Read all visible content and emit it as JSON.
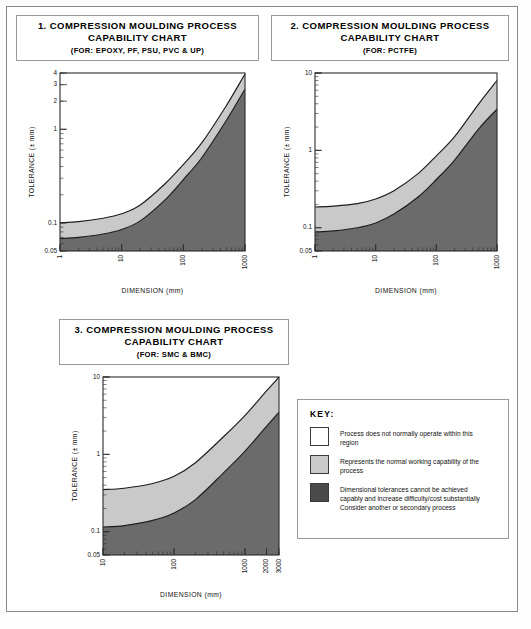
{
  "key_panel": {
    "title": "KEY:",
    "entries": [
      {
        "swatch": "white",
        "text": "Process does not normally operate within this region"
      },
      {
        "swatch": "light-gray",
        "text": "Represents the normal working capability of the process"
      },
      {
        "swatch": "dark-gray",
        "text": "Dimensional tolerances cannot be achieved capably and increase difficulty/cost substantially Consider another or secondary process"
      }
    ]
  },
  "colors": {
    "band_light": "#c9c9c9",
    "band_dark": "#6b6b6b",
    "curve": "#1c1c1c",
    "frame": "#8a8a8a"
  },
  "chart_data": [
    {
      "type": "area",
      "id": "chart-1",
      "title": "1. COMPRESSION MOULDING PROCESS CAPABILITY CHART",
      "subtitle": "(FOR: EPOXY, PF, PSU, PVC & UP)",
      "xlabel": "DIMENSION (mm)",
      "ylabel": "TOLERANCE (± mm)",
      "xscale": "log",
      "yscale": "log",
      "xlim": [
        1,
        1000
      ],
      "ylim": [
        0.05,
        4
      ],
      "xticks": [
        1,
        10,
        100,
        1000
      ],
      "xticklabels": [
        "1",
        "10",
        "100",
        "1000"
      ],
      "yticks": [
        0.05,
        0.1,
        1,
        2,
        3,
        4
      ],
      "yticklabels": [
        "0.05",
        "0.1",
        "1",
        "2",
        "3",
        "4"
      ],
      "grid": false,
      "legend": "none",
      "series": [
        {
          "name": "upper boundary",
          "x": [
            1,
            2,
            5,
            10,
            20,
            50,
            100,
            200,
            500,
            1000
          ],
          "y": [
            0.1,
            0.103,
            0.112,
            0.125,
            0.155,
            0.26,
            0.42,
            0.72,
            1.8,
            3.9
          ]
        },
        {
          "name": "lower boundary",
          "x": [
            1,
            2,
            5,
            10,
            20,
            50,
            100,
            200,
            500,
            1000
          ],
          "y": [
            0.068,
            0.07,
            0.076,
            0.085,
            0.105,
            0.175,
            0.29,
            0.5,
            1.25,
            2.7
          ]
        }
      ]
    },
    {
      "type": "area",
      "id": "chart-2",
      "title": "2. COMPRESSION MOULDING PROCESS CAPABILITY CHART",
      "subtitle": "(FOR: PCTFE)",
      "xlabel": "DIMENSION (mm)",
      "ylabel": "TOLERANCE (± mm)",
      "xscale": "log",
      "yscale": "log",
      "xlim": [
        1,
        1000
      ],
      "ylim": [
        0.05,
        10
      ],
      "xticks": [
        1,
        10,
        100,
        1000
      ],
      "xticklabels": [
        "1",
        "10",
        "100",
        "1000"
      ],
      "yticks": [
        0.05,
        0.1,
        1,
        10
      ],
      "yticklabels": [
        "0.05",
        "0.1",
        "1",
        "10"
      ],
      "grid": false,
      "legend": "none",
      "series": [
        {
          "name": "upper boundary",
          "x": [
            1,
            2,
            5,
            10,
            20,
            50,
            100,
            200,
            500,
            1000
          ],
          "y": [
            0.185,
            0.19,
            0.205,
            0.235,
            0.3,
            0.5,
            0.85,
            1.5,
            4.0,
            8.0
          ]
        },
        {
          "name": "lower boundary",
          "x": [
            1,
            2,
            5,
            10,
            20,
            50,
            100,
            200,
            500,
            1000
          ],
          "y": [
            0.088,
            0.091,
            0.1,
            0.115,
            0.15,
            0.25,
            0.42,
            0.75,
            1.9,
            3.4
          ]
        }
      ]
    },
    {
      "type": "area",
      "id": "chart-3",
      "title": "3. COMPRESSION MOULDING PROCESS CAPABILITY CHART",
      "subtitle": "(FOR: SMC & BMC)",
      "xlabel": "DIMENSION (mm)",
      "ylabel": "TOLERANCE (± mm)",
      "xscale": "log",
      "yscale": "log",
      "xlim": [
        10,
        3000
      ],
      "ylim": [
        0.05,
        10
      ],
      "xticks": [
        10,
        100,
        1000,
        2000,
        3000
      ],
      "xticklabels": [
        "10",
        "100",
        "1000",
        "2000",
        "3000"
      ],
      "yticks": [
        0.05,
        0.1,
        1,
        10
      ],
      "yticklabels": [
        "0.05",
        "0.1",
        "1",
        "10"
      ],
      "grid": false,
      "legend": "none",
      "series": [
        {
          "name": "upper boundary",
          "x": [
            10,
            20,
            50,
            100,
            200,
            500,
            1000,
            2000,
            3000
          ],
          "y": [
            0.35,
            0.365,
            0.42,
            0.52,
            0.78,
            1.7,
            3.2,
            6.6,
            10.0
          ]
        },
        {
          "name": "lower boundary",
          "x": [
            10,
            20,
            50,
            100,
            200,
            500,
            1000,
            2000,
            3000
          ],
          "y": [
            0.115,
            0.12,
            0.14,
            0.175,
            0.26,
            0.58,
            1.1,
            2.3,
            3.5
          ]
        }
      ]
    }
  ]
}
